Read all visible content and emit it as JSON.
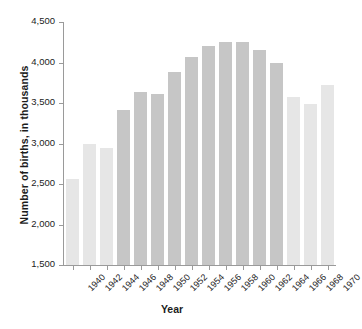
{
  "chart_data": {
    "type": "bar",
    "title": "",
    "xlabel": "Year",
    "ylabel": "Number of births, in thousands",
    "categories": [
      "1940",
      "1942",
      "1944",
      "1946",
      "1948",
      "1950",
      "1952",
      "1954",
      "1956",
      "1958",
      "1960",
      "1962",
      "1964",
      "1966",
      "1968",
      "1970"
    ],
    "values": [
      2560,
      2990,
      2940,
      3410,
      3630,
      3610,
      3880,
      4070,
      4200,
      4250,
      4250,
      4160,
      4000,
      3580,
      3490,
      3720
    ],
    "series": [
      {
        "name": "Number of births",
        "values": [
          2560,
          2990,
          2940,
          3410,
          3630,
          3610,
          3880,
          4070,
          4200,
          4250,
          4250,
          4160,
          4000,
          3580,
          3490,
          3720
        ]
      }
    ],
    "ylim": [
      1500,
      4500
    ],
    "ytick_values": [
      1500,
      2000,
      2500,
      3000,
      3500,
      4000,
      4500
    ],
    "ytick_labels": [
      "1,500",
      "2,000",
      "2,500",
      "3,000",
      "3,500",
      "4,000",
      "4,500"
    ],
    "grid": false,
    "legend": "none",
    "bar_colors": [
      "#e6e6e6",
      "#e6e6e6",
      "#e6e6e6",
      "#c6c6c6",
      "#c6c6c6",
      "#c6c6c6",
      "#c6c6c6",
      "#c6c6c6",
      "#c6c6c6",
      "#c6c6c6",
      "#c6c6c6",
      "#c6c6c6",
      "#c6c6c6",
      "#e6e6e6",
      "#e6e6e6",
      "#e6e6e6"
    ],
    "palette": {
      "bar_light": "#e6e6e6",
      "bar_dark": "#c6c6c6",
      "axis": "#9a9a9a",
      "text": "#1c1c1c",
      "background": "#ffffff"
    }
  }
}
